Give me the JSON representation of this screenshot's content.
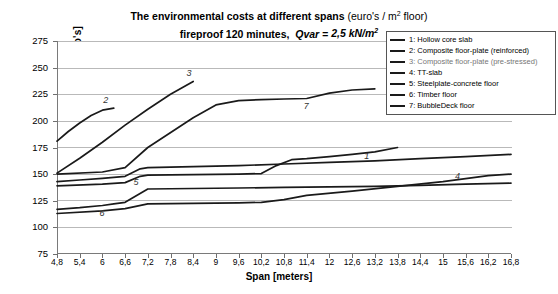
{
  "title": {
    "line1_bold": "The environmental costs at different spans",
    "line1_normal": "(euro's / m² floor)",
    "line2_bold": "fireproof 120 minutes, ",
    "line2_italic": "Qvar = 2,5 kN/m²"
  },
  "axes": {
    "y_label": "Environmental costs [euro's]",
    "x_label": "Span [meters]",
    "y_ticks": [
      "275",
      "250",
      "225",
      "200",
      "175",
      "150",
      "125",
      "100",
      "75"
    ],
    "x_ticks": [
      "4,8",
      "5,4",
      "6",
      "6,6",
      "7,2",
      "7,8",
      "8,4",
      "9",
      "9,6",
      "10,2",
      "10,8",
      "11,4",
      "12",
      "12,6",
      "13,2",
      "13,8",
      "14,4",
      "15",
      "15,6",
      "16,2",
      "16,8"
    ]
  },
  "legend": {
    "items": [
      {
        "id": "1",
        "label": "1: Hollow core slab"
      },
      {
        "id": "2",
        "label": "2: Composite floor-plate (reinforced)"
      },
      {
        "id": "3",
        "label": "3: Composite floor-plate (pre-stressed)"
      },
      {
        "id": "4",
        "label": "4: TT-slab"
      },
      {
        "id": "5",
        "label": "5: Steelplate-concrete floor"
      },
      {
        "id": "6",
        "label": "6: Timber floor"
      },
      {
        "id": "7",
        "label": "7: BubbleDeck floor"
      }
    ]
  },
  "series_labels": [
    {
      "name": "1",
      "text": "1"
    },
    {
      "name": "2",
      "text": "2"
    },
    {
      "name": "3",
      "text": "3"
    },
    {
      "name": "4",
      "text": "4"
    },
    {
      "name": "5",
      "text": "5"
    },
    {
      "name": "6",
      "text": "6"
    },
    {
      "name": "7",
      "text": "7"
    }
  ],
  "chart_data": {
    "type": "line",
    "xlabel": "Span [meters]",
    "ylabel": "Environmental costs [euro's]",
    "xlim": [
      4.8,
      16.8
    ],
    "ylim": [
      75,
      275
    ],
    "ytick_step": 25,
    "xtick_step": 0.6,
    "grid": "horizontal",
    "legend_position": "top-right",
    "series": [
      {
        "name": "1: Hollow core slab",
        "x": [
          4.8,
          6.0,
          6.6,
          7.0,
          7.2,
          8.4,
          9.6,
          10.2,
          10.6,
          11.0,
          11.4,
          12.0,
          12.6,
          13.2,
          13.8
        ],
        "y": [
          139.0,
          140.5,
          142.0,
          148.0,
          149.0,
          149.5,
          150.0,
          150.5,
          158.0,
          163.5,
          164.5,
          166.5,
          168.5,
          171.0,
          175.0
        ]
      },
      {
        "name": "2: Composite floor-plate (reinforced)",
        "x": [
          4.8,
          5.1,
          5.4,
          5.7,
          6.0,
          6.3
        ],
        "y": [
          181.0,
          190.0,
          198.0,
          205.0,
          210.0,
          212.0
        ]
      },
      {
        "name": "3: Composite floor-plate (pre-stressed)",
        "x": [
          4.8,
          5.4,
          6.0,
          6.6,
          7.2,
          7.8,
          8.4
        ],
        "y": [
          151.0,
          165.0,
          180.0,
          196.0,
          211.0,
          225.0,
          237.0
        ]
      },
      {
        "name": "4: TT-slab",
        "x": [
          4.8,
          6.0,
          6.6,
          7.2,
          8.4,
          9.6,
          10.2,
          10.8,
          11.4,
          12.6,
          13.8,
          15.0,
          16.2,
          16.8
        ],
        "y": [
          113.0,
          115.5,
          117.5,
          122.0,
          122.5,
          123.0,
          123.5,
          126.0,
          130.0,
          134.0,
          138.5,
          143.0,
          148.5,
          150.0
        ]
      },
      {
        "name": "5: Steelplate-concrete floor",
        "x": [
          4.8,
          5.4,
          6.0,
          6.6,
          7.0,
          7.2,
          8.4,
          9.6,
          10.8,
          12.0,
          13.2,
          14.4,
          15.6,
          16.8
        ],
        "y": [
          143.0,
          144.5,
          146.0,
          148.0,
          155.0,
          156.0,
          157.0,
          158.0,
          159.5,
          161.0,
          162.5,
          164.5,
          166.5,
          168.5
        ]
      },
      {
        "name": "6: Timber floor",
        "x": [
          4.8,
          5.4,
          6.0,
          6.3,
          6.6,
          7.2,
          8.4,
          9.6,
          10.8,
          12.0,
          13.2,
          14.4,
          15.6,
          16.8
        ],
        "y": [
          117.0,
          118.5,
          120.5,
          122.0,
          123.5,
          136.0,
          136.5,
          137.0,
          137.5,
          138.0,
          138.5,
          139.5,
          140.5,
          141.5
        ]
      },
      {
        "name": "7: BubbleDeck floor",
        "x": [
          4.8,
          6.0,
          6.6,
          7.2,
          8.4,
          9.0,
          9.6,
          10.2,
          10.8,
          11.4,
          12.0,
          12.6,
          13.2
        ],
        "y": [
          150.0,
          152.0,
          156.0,
          175.0,
          203.0,
          215.0,
          219.0,
          220.0,
          220.5,
          221.0,
          226.0,
          229.0,
          230.0
        ]
      }
    ]
  }
}
